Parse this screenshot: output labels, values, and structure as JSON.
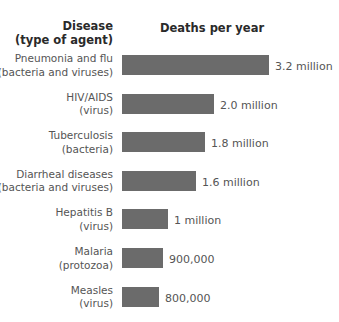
{
  "header": {
    "disease_line1": "Disease",
    "disease_line2": "(type of agent)",
    "deaths": "Deaths per year"
  },
  "rows": [
    {
      "line1": "Pneumonia and flu",
      "line2": "(bacteria and viruses)",
      "value_label": "3.2 million"
    },
    {
      "line1": "HIV/AIDS",
      "line2": "(virus)",
      "value_label": "2.0 million"
    },
    {
      "line1": "Tuberculosis",
      "line2": "(bacteria)",
      "value_label": "1.8 million"
    },
    {
      "line1": "Diarrheal diseases",
      "line2": "(bacteria and viruses)",
      "value_label": "1.6 million"
    },
    {
      "line1": "Hepatitis B",
      "line2": "(virus)",
      "value_label": "1 million"
    },
    {
      "line1": "Malaria",
      "line2": "(protozoa)",
      "value_label": "900,000"
    },
    {
      "line1": "Measles",
      "line2": "(virus)",
      "value_label": "800,000"
    }
  ],
  "colors": {
    "bar": "#6b6b6b",
    "text": "#555555",
    "header_text": "#2a2a2a",
    "background": "#ffffff"
  },
  "chart_data": {
    "type": "bar",
    "orientation": "horizontal",
    "title": "",
    "xlabel": "Deaths per year",
    "ylabel": "Disease (type of agent)",
    "categories": [
      "Pneumonia and flu (bacteria and viruses)",
      "HIV/AIDS (virus)",
      "Tuberculosis (bacteria)",
      "Diarrheal diseases (bacteria and viruses)",
      "Hepatitis B (virus)",
      "Malaria (protozoa)",
      "Measles (virus)"
    ],
    "values": [
      3200000,
      2000000,
      1800000,
      1600000,
      1000000,
      900000,
      800000
    ],
    "value_labels": [
      "3.2 million",
      "2.0 million",
      "1.8 million",
      "1.6 million",
      "1 million",
      "900,000",
      "800,000"
    ],
    "grid": false,
    "legend": null,
    "xlim": [
      0,
      3200000
    ]
  }
}
